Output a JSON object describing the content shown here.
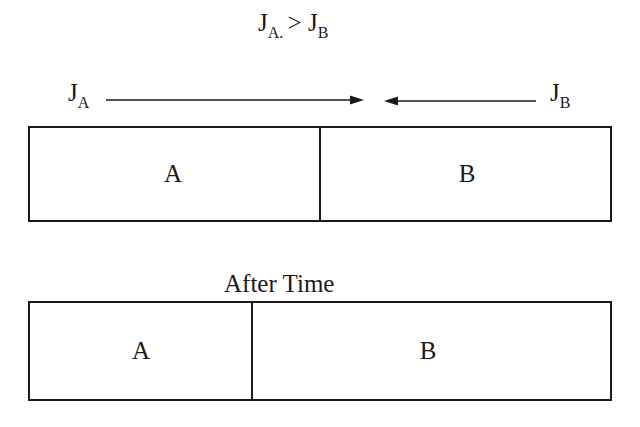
{
  "diagram": {
    "condition": {
      "j_a_base": "J",
      "j_a_sub": "A.",
      "operator": ">",
      "j_b_base": "J",
      "j_b_sub": "B"
    },
    "flux_left": {
      "base": "J",
      "sub": "A",
      "direction": "right"
    },
    "flux_right": {
      "base": "J",
      "sub": "B",
      "direction": "left"
    },
    "before": {
      "regions": [
        {
          "label": "A",
          "fraction": 0.5
        },
        {
          "label": "B",
          "fraction": 0.5
        }
      ]
    },
    "caption": "After Time",
    "after": {
      "regions": [
        {
          "label": "A",
          "fraction": 0.385
        },
        {
          "label": "B",
          "fraction": 0.615
        }
      ]
    },
    "colors": {
      "stroke": "#1a1a1a",
      "background": "#ffffff"
    }
  }
}
